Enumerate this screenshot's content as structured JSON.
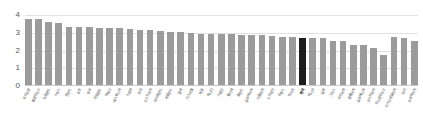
{
  "chart_data": {
    "type": "bar",
    "title": "",
    "subtitle": "",
    "xlabel": "",
    "ylabel": "",
    "ylim": [
      0,
      4
    ],
    "yticks": [
      0,
      1,
      2,
      3,
      4
    ],
    "grid": true,
    "legend": "none",
    "highlight_category": "한국",
    "colors": {
      "bar": "#9b9b9b",
      "highlight_bar": "#1c1c1c",
      "grid": "#e2e2e2",
      "axis_text": "#555555",
      "background": "#ffffff"
    },
    "categories": [
      "포르투갈",
      "룩셈부르크",
      "뉴질랜드",
      "스위스",
      "핀란드",
      "호주",
      "영국",
      "아일랜드",
      "덱마크",
      "에스토니아",
      "스웨덴",
      "미국",
      "오스트리아",
      "아이슬란드",
      "네덜란드",
      "칠레",
      "이스라엘",
      "독일",
      "캐나다",
      "스페인",
      "벨기에",
      "폴란드",
      "슬로바키아",
      "이탈리아",
      "노르웨이",
      "프랑스",
      "헝가리",
      "한국",
      "멕시코",
      "일본",
      "그리스",
      "라트비아",
      "콜롬비아",
      "슬로베니아",
      "코스타리카",
      "르크셈부르크",
      "오스트레일리아",
      "터키",
      "슈로바키아"
    ],
    "values": [
      3.8,
      3.8,
      3.62,
      3.55,
      3.34,
      3.32,
      3.31,
      3.27,
      3.26,
      3.26,
      3.22,
      3.16,
      3.13,
      3.07,
      3.02,
      3.01,
      2.96,
      2.93,
      2.91,
      2.9,
      2.9,
      2.88,
      2.86,
      2.83,
      2.82,
      2.72,
      2.72,
      2.67,
      2.66,
      2.66,
      2.52,
      2.52,
      2.31,
      2.3,
      2.1,
      1.74,
      2.72,
      2.66,
      2.52
    ]
  }
}
